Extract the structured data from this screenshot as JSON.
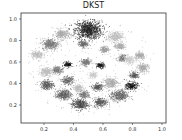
{
  "chart_data": {
    "type": "scatter",
    "title": "DKST",
    "xlabel": "",
    "ylabel": "",
    "xlim": [
      0.05,
      1.02
    ],
    "ylim": [
      0.08,
      1.03
    ],
    "xticks": [
      "0.2",
      "0.4",
      "0.6",
      "0.8",
      "1.0"
    ],
    "yticks": [
      "0.2",
      "0.4",
      "0.6",
      "0.8",
      "1.0"
    ],
    "grid": false,
    "legend": null,
    "clusters": [
      {
        "x": 0.5,
        "y": 0.9,
        "r": 0.1,
        "shade": "#222222"
      },
      {
        "x": 0.32,
        "y": 0.86,
        "r": 0.055,
        "shade": "#aaaaaa"
      },
      {
        "x": 0.68,
        "y": 0.84,
        "r": 0.055,
        "shade": "#bbbbbb"
      },
      {
        "x": 0.24,
        "y": 0.77,
        "r": 0.06,
        "shade": "#777777"
      },
      {
        "x": 0.46,
        "y": 0.77,
        "r": 0.035,
        "shade": "#666666"
      },
      {
        "x": 0.71,
        "y": 0.75,
        "r": 0.04,
        "shade": "#aaaaaa"
      },
      {
        "x": 0.61,
        "y": 0.72,
        "r": 0.035,
        "shade": "#999999"
      },
      {
        "x": 0.15,
        "y": 0.67,
        "r": 0.045,
        "shade": "#bbbbbb"
      },
      {
        "x": 0.85,
        "y": 0.66,
        "r": 0.04,
        "shade": "#aaaaaa"
      },
      {
        "x": 0.73,
        "y": 0.64,
        "r": 0.035,
        "shade": "#777777"
      },
      {
        "x": 0.48,
        "y": 0.6,
        "r": 0.04,
        "shade": "#777777"
      },
      {
        "x": 0.36,
        "y": 0.58,
        "r": 0.03,
        "shade": "#111111"
      },
      {
        "x": 0.58,
        "y": 0.57,
        "r": 0.03,
        "shade": "#111111"
      },
      {
        "x": 0.78,
        "y": 0.62,
        "r": 0.04,
        "shade": "#cccccc"
      },
      {
        "x": 0.29,
        "y": 0.53,
        "r": 0.04,
        "shade": "#777777"
      },
      {
        "x": 0.21,
        "y": 0.51,
        "r": 0.05,
        "shade": "#bbbbbb"
      },
      {
        "x": 0.87,
        "y": 0.55,
        "r": 0.045,
        "shade": "#aaaaaa"
      },
      {
        "x": 0.81,
        "y": 0.48,
        "r": 0.035,
        "shade": "#555555"
      },
      {
        "x": 0.36,
        "y": 0.43,
        "r": 0.045,
        "shade": "#666666"
      },
      {
        "x": 0.53,
        "y": 0.48,
        "r": 0.035,
        "shade": "#cccccc"
      },
      {
        "x": 0.22,
        "y": 0.39,
        "r": 0.05,
        "shade": "#555555"
      },
      {
        "x": 0.65,
        "y": 0.41,
        "r": 0.055,
        "shade": "#aaaaaa"
      },
      {
        "x": 0.79,
        "y": 0.38,
        "r": 0.045,
        "shade": "#111111"
      },
      {
        "x": 0.56,
        "y": 0.37,
        "r": 0.04,
        "shade": "#555555"
      },
      {
        "x": 0.43,
        "y": 0.36,
        "r": 0.04,
        "shade": "#bbbbbb"
      },
      {
        "x": 0.33,
        "y": 0.3,
        "r": 0.055,
        "shade": "#555555"
      },
      {
        "x": 0.47,
        "y": 0.3,
        "r": 0.04,
        "shade": "#777777"
      },
      {
        "x": 0.71,
        "y": 0.29,
        "r": 0.065,
        "shade": "#666666"
      },
      {
        "x": 0.58,
        "y": 0.23,
        "r": 0.05,
        "shade": "#555555"
      },
      {
        "x": 0.44,
        "y": 0.21,
        "r": 0.06,
        "shade": "#444444"
      }
    ]
  }
}
